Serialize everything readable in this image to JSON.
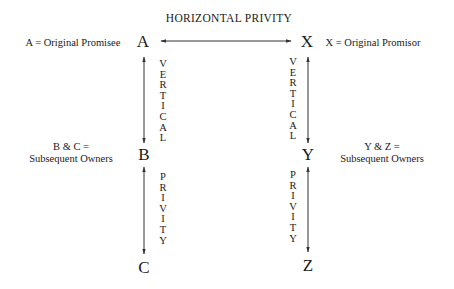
{
  "title": "HORIZONTAL PRIVITY",
  "nodes": {
    "A": "A",
    "B": "B",
    "C": "C",
    "X": "X",
    "Y": "Y",
    "Z": "Z"
  },
  "labels": {
    "a_label": "A = Original Promisee",
    "x_label": "X = Original Promisor",
    "bc_label_line1": "B & C =",
    "bc_label_line2": "Subsequent Owners",
    "yz_label_line1": "Y & Z =",
    "yz_label_line2": "Subsequent Owners"
  },
  "vertical_text": {
    "word1": [
      "V",
      "E",
      "R",
      "T",
      "I",
      "C",
      "A",
      "L"
    ],
    "word2": [
      "P",
      "R",
      "I",
      "V",
      "I",
      "T",
      "Y"
    ]
  },
  "colors": {
    "text": "#1a1a1a",
    "line": "#333333",
    "background": "#ffffff"
  }
}
